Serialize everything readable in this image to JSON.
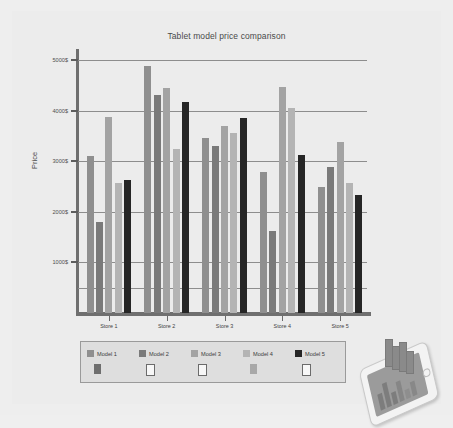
{
  "chart_data": {
    "type": "bar",
    "title": "Tablet model price comparison",
    "xlabel": "",
    "ylabel": "Price",
    "categories": [
      "Store 1",
      "Store 2",
      "Store 3",
      "Store 4",
      "Store 5"
    ],
    "ylim": [
      0,
      5000
    ],
    "yticks": [
      1000,
      2000,
      3000,
      4000,
      5000
    ],
    "ytick_labels": [
      "1000$",
      "2000$",
      "3000$",
      "4000$",
      "5000$"
    ],
    "grid": true,
    "legend_position": "bottom",
    "series": [
      {
        "name": "Model 1",
        "color": "#8f8f8f",
        "values": [
          3100,
          4880,
          3450,
          2790,
          2500
        ]
      },
      {
        "name": "Model 2",
        "color": "#7a7a7a",
        "values": [
          1800,
          4300,
          3300,
          1630,
          2880
        ]
      },
      {
        "name": "Model 3",
        "color": "#a3a3a3",
        "values": [
          3870,
          4450,
          3700,
          4460,
          3370
        ]
      },
      {
        "name": "Model 4",
        "color": "#b4b4b4",
        "values": [
          2560,
          3250,
          3550,
          4050,
          2560
        ]
      },
      {
        "name": "Model 5",
        "color": "#262626",
        "values": [
          2620,
          4170,
          3860,
          3120,
          2330
        ]
      }
    ]
  },
  "legend": {
    "entries": [
      {
        "label": "Model 1",
        "swatch_color": "#8f8f8f",
        "mark_style": "filled",
        "mark_color": "#6e6e6e"
      },
      {
        "label": "Model 2",
        "swatch_color": "#7a7a7a",
        "mark_style": "hollow",
        "mark_color": "#f7f7f7"
      },
      {
        "label": "Model 3",
        "swatch_color": "#a3a3a3",
        "mark_style": "hollow",
        "mark_color": "#ffffff"
      },
      {
        "label": "Model 4",
        "swatch_color": "#b4b4b4",
        "mark_style": "filled",
        "mark_color": "#a8a8a8"
      },
      {
        "label": "Model 5",
        "swatch_color": "#262626",
        "mark_style": "hollow",
        "mark_color": "#f7f7f7"
      }
    ]
  },
  "illustration": {
    "name": "tablet-with-3d-bar-chart"
  },
  "colors": {
    "page_background": "#eeeeee",
    "figure_background": "#ececec",
    "axis": "#6f6f6f",
    "gridline": "#8d8d8d",
    "text": "#4a4a4a",
    "legend_background": "#dedede"
  }
}
